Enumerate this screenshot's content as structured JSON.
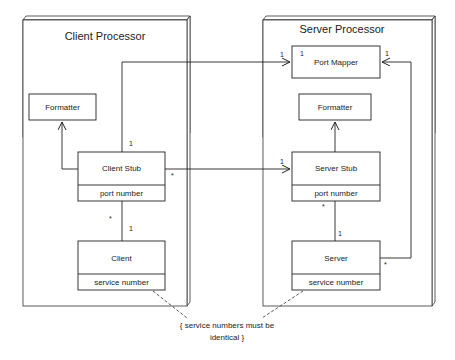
{
  "nodes": {
    "client_processor": {
      "title": "Client Processor"
    },
    "server_processor": {
      "title": "Server Processor"
    }
  },
  "classes": {
    "client_formatter": {
      "name": "Formatter"
    },
    "client_stub": {
      "name": "Client Stub",
      "attribute": "port number"
    },
    "client": {
      "name": "Client",
      "attribute": "service number"
    },
    "port_mapper": {
      "name": "Port Mapper"
    },
    "server_formatter": {
      "name": "Formatter"
    },
    "server_stub": {
      "name": "Server Stub",
      "attribute": "port number"
    },
    "server": {
      "name": "Server",
      "attribute": "service number"
    }
  },
  "multiplicities": {
    "client_stub_to_port_mapper_src": "1",
    "client_stub_to_port_mapper_dst": "1",
    "port_mapper_inner": "1",
    "server_to_port_mapper_dst": "1",
    "server_to_port_mapper_src": "*",
    "client_stub_to_server_stub_src": "*",
    "client_stub_to_server_stub_dst": "1",
    "client_stub_client_top": "*",
    "client_stub_client_bottom": "1",
    "server_stub_server_top": "*",
    "server_stub_server_bottom": "1"
  },
  "constraint": {
    "line1": "{ service numbers must be",
    "line2": "identical }"
  }
}
